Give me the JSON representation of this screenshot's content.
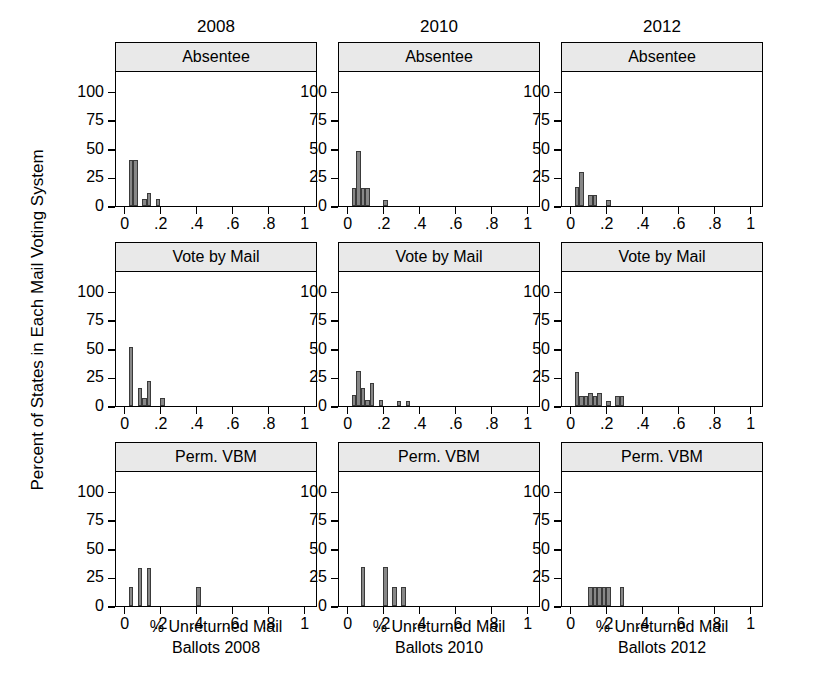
{
  "figure": {
    "ylabel": "Percent of States in Each Mail Voting System",
    "column_titles": [
      "2008",
      "2010",
      "2012"
    ],
    "row_titles": [
      "Absentee",
      "Vote by Mail",
      "Perm. VBM"
    ],
    "xlabels": [
      "% Unreturned Mail Ballots 2008",
      "% Unreturned Mail Ballots 2010",
      "% Unreturned Mail Ballots 2012"
    ],
    "xlabel_lines": [
      [
        "% Unreturned Mail",
        "Ballots 2008"
      ],
      [
        "% Unreturned Mail",
        "Ballots 2010"
      ],
      [
        "% Unreturned Mail",
        "Ballots 2012"
      ]
    ],
    "ytick_labels": [
      "0",
      "25",
      "50",
      "75",
      "100"
    ],
    "ytick_values": [
      0,
      25,
      50,
      75,
      100
    ],
    "xtick_labels": [
      "0",
      ".2",
      ".4",
      ".6",
      ".8",
      "1"
    ],
    "xtick_values": [
      0,
      0.2,
      0.4,
      0.6,
      0.8,
      1
    ],
    "colors": {
      "bar_fill": "#878787",
      "bar_edge": "#3a3a3a",
      "strip_background": "#e9e9e9",
      "panel_border": "#000000",
      "background": "#ffffff"
    }
  },
  "chart_data": {
    "type": "bar",
    "title": "",
    "xlabel": "% Unreturned Mail Ballots",
    "ylabel": "Percent of States in Each Mail Voting System",
    "xlim": [
      -0.045,
      1.06
    ],
    "ylim": [
      0,
      118
    ],
    "grid": false,
    "legend": "none",
    "layout": "3 columns (years) x 3 rows (mail voting system), small-multiple histograms",
    "bin_width": 0.025,
    "panels": [
      {
        "column": "2008",
        "row": "Absentee",
        "bins": [
          {
            "x": 0.025,
            "height": 40
          },
          {
            "x": 0.05,
            "height": 40
          },
          {
            "x": 0.1,
            "height": 6
          },
          {
            "x": 0.125,
            "height": 11
          },
          {
            "x": 0.175,
            "height": 6
          }
        ]
      },
      {
        "column": "2008",
        "row": "Vote by Mail",
        "bins": [
          {
            "x": 0.025,
            "height": 52
          },
          {
            "x": 0.075,
            "height": 16
          },
          {
            "x": 0.1,
            "height": 7
          },
          {
            "x": 0.125,
            "height": 22
          },
          {
            "x": 0.2,
            "height": 7
          }
        ]
      },
      {
        "column": "2008",
        "row": "Perm. VBM",
        "bins": [
          {
            "x": 0.025,
            "height": 17
          },
          {
            "x": 0.075,
            "height": 33
          },
          {
            "x": 0.125,
            "height": 33
          },
          {
            "x": 0.4,
            "height": 17
          }
        ]
      },
      {
        "column": "2010",
        "row": "Absentee",
        "bins": [
          {
            "x": 0.025,
            "height": 16
          },
          {
            "x": 0.05,
            "height": 48
          },
          {
            "x": 0.075,
            "height": 16
          },
          {
            "x": 0.1,
            "height": 16
          },
          {
            "x": 0.2,
            "height": 5
          }
        ]
      },
      {
        "column": "2010",
        "row": "Vote by Mail",
        "bins": [
          {
            "x": 0.025,
            "height": 10
          },
          {
            "x": 0.05,
            "height": 31
          },
          {
            "x": 0.075,
            "height": 16
          },
          {
            "x": 0.1,
            "height": 5
          },
          {
            "x": 0.125,
            "height": 20
          },
          {
            "x": 0.175,
            "height": 5
          },
          {
            "x": 0.275,
            "height": 4
          },
          {
            "x": 0.325,
            "height": 4
          }
        ]
      },
      {
        "column": "2010",
        "row": "Perm. VBM",
        "bins": [
          {
            "x": 0.075,
            "height": 34
          },
          {
            "x": 0.2,
            "height": 34
          },
          {
            "x": 0.25,
            "height": 17
          },
          {
            "x": 0.3,
            "height": 17
          }
        ]
      },
      {
        "column": "2012",
        "row": "Absentee",
        "bins": [
          {
            "x": 0.025,
            "height": 17
          },
          {
            "x": 0.05,
            "height": 30
          },
          {
            "x": 0.1,
            "height": 10
          },
          {
            "x": 0.125,
            "height": 10
          },
          {
            "x": 0.2,
            "height": 5
          }
        ]
      },
      {
        "column": "2012",
        "row": "Vote by Mail",
        "bins": [
          {
            "x": 0.025,
            "height": 30
          },
          {
            "x": 0.05,
            "height": 9
          },
          {
            "x": 0.075,
            "height": 9
          },
          {
            "x": 0.1,
            "height": 11
          },
          {
            "x": 0.125,
            "height": 9
          },
          {
            "x": 0.15,
            "height": 11
          },
          {
            "x": 0.2,
            "height": 4
          },
          {
            "x": 0.25,
            "height": 9
          },
          {
            "x": 0.275,
            "height": 9
          }
        ]
      },
      {
        "column": "2012",
        "row": "Perm. VBM",
        "bins": [
          {
            "x": 0.1,
            "height": 17
          },
          {
            "x": 0.125,
            "height": 17
          },
          {
            "x": 0.15,
            "height": 17
          },
          {
            "x": 0.175,
            "height": 17
          },
          {
            "x": 0.2,
            "height": 17
          },
          {
            "x": 0.275,
            "height": 17
          }
        ]
      }
    ]
  }
}
